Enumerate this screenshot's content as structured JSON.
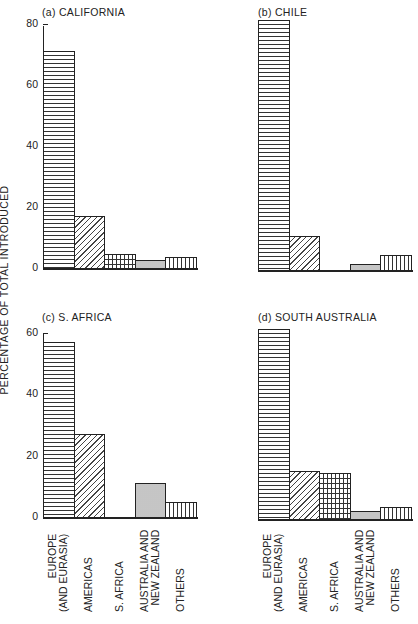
{
  "y_axis_label": "PERCENTAGE OF TOTAL INTRODUCED",
  "categories": [
    "EUROPE (AND EURASIA)",
    "AMERICAS",
    "S. AFRICA",
    "AUSTRALIA AND NEW ZEALAND",
    "OTHERS"
  ],
  "category_labels_lines": [
    [
      "EUROPE",
      "(AND EURASIA)"
    ],
    [
      "AMERICAS"
    ],
    [
      "S. AFRICA"
    ],
    [
      "AUSTRALIA AND",
      "NEW ZEALAND"
    ],
    [
      "OTHERS"
    ]
  ],
  "panels": [
    {
      "title": "(a) CALIFORNIA",
      "ticks": [
        "80",
        "60",
        "40",
        "20",
        "0"
      ]
    },
    {
      "title": "(b) CHILE"
    },
    {
      "title": "(c) S. AFRICA",
      "ticks": [
        "60",
        "40",
        "20",
        "0"
      ]
    },
    {
      "title": "(d) SOUTH AUSTRALIA"
    }
  ],
  "chart_data": [
    {
      "type": "bar",
      "title": "(a) CALIFORNIA",
      "xlabel": "",
      "ylabel": "PERCENTAGE OF TOTAL INTRODUCED",
      "categories": [
        "EUROPE (AND EURASIA)",
        "AMERICAS",
        "S. AFRICA",
        "AUSTRALIA AND NEW ZEALAND",
        "OTHERS"
      ],
      "values": [
        71,
        17,
        4.5,
        2.5,
        3.5
      ],
      "ylim": [
        0,
        80
      ],
      "yticks": [
        0,
        20,
        40,
        60,
        80
      ],
      "grid": false,
      "patterns": [
        "horizontal-lines",
        "diagonal-hatch",
        "brick-grid",
        "stipple",
        "vertical-lines"
      ]
    },
    {
      "type": "bar",
      "title": "(b) CHILE",
      "xlabel": "",
      "ylabel": "PERCENTAGE OF TOTAL INTRODUCED",
      "categories": [
        "EUROPE (AND EURASIA)",
        "AMERICAS",
        "S. AFRICA",
        "AUSTRALIA AND NEW ZEALAND",
        "OTHERS"
      ],
      "values": [
        82,
        11,
        0,
        2,
        5
      ],
      "ylim": [
        0,
        80
      ],
      "yticks": [
        0,
        20,
        40,
        60,
        80
      ],
      "grid": false
    },
    {
      "type": "bar",
      "title": "(c) S. AFRICA",
      "xlabel": "",
      "ylabel": "PERCENTAGE OF TOTAL INTRODUCED",
      "categories": [
        "EUROPE (AND EURASIA)",
        "AMERICAS",
        "S. AFRICA",
        "AUSTRALIA AND NEW ZEALAND",
        "OTHERS"
      ],
      "values": [
        57,
        27,
        0,
        11,
        5
      ],
      "ylim": [
        0,
        60
      ],
      "yticks": [
        0,
        20,
        40,
        60
      ],
      "grid": false
    },
    {
      "type": "bar",
      "title": "(d) SOUTH AUSTRALIA",
      "xlabel": "",
      "ylabel": "PERCENTAGE OF TOTAL INTRODUCED",
      "categories": [
        "EUROPE (AND EURASIA)",
        "AMERICAS",
        "S. AFRICA",
        "AUSTRALIA AND NEW ZEALAND",
        "OTHERS"
      ],
      "values": [
        62,
        15.5,
        15,
        2.5,
        4
      ],
      "ylim": [
        0,
        60
      ],
      "yticks": [
        0,
        20,
        40,
        60
      ],
      "grid": false
    }
  ]
}
